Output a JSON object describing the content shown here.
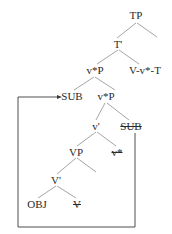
{
  "diagram": {
    "type": "syntax-tree",
    "cut_off_top_text": "",
    "nodes": {
      "tp": "TP",
      "t_bar": "T'",
      "vstar_p_upper": "v*P",
      "v_vstar_t": "V-v*-T",
      "sub": "SUB",
      "vstar_p_lower": "v*P",
      "v_bar": "v'",
      "sub_trace": "SUB",
      "vp": "VP",
      "vstar_trace": "v*",
      "V_bar": "V'",
      "obj": "OBJ",
      "v_trace": "V"
    },
    "edges": [
      [
        "TP",
        "T'"
      ],
      [
        "TP",
        "(empty)"
      ],
      [
        "T'",
        "v*P"
      ],
      [
        "T'",
        "V-v*-T"
      ],
      [
        "v*P",
        "SUB"
      ],
      [
        "v*P",
        "v*P"
      ],
      [
        "v*P",
        "v'"
      ],
      [
        "v*P",
        "SUB(trace)"
      ],
      [
        "v'",
        "VP"
      ],
      [
        "v'",
        "v*(trace)"
      ],
      [
        "VP",
        "V'"
      ],
      [
        "VP",
        "(empty)"
      ],
      [
        "V'",
        "OBJ"
      ],
      [
        "V'",
        "V(trace)"
      ]
    ],
    "movement_arrow": {
      "from": "SUB (struck trace)",
      "to": "SUB (specifier of v*P)"
    },
    "colors": {
      "text": "#2a2a2a",
      "lines": "#9a9a9a",
      "arrow": "#3a3a3a"
    }
  }
}
